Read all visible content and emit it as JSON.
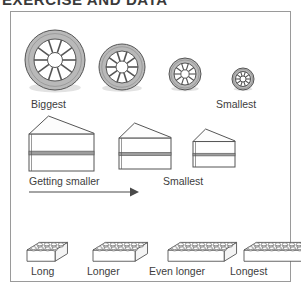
{
  "heading": "EXERCISE AND DATA",
  "figure": {
    "border_color": "#9a9a9a",
    "background": "#ffffff",
    "text_color": "#3d3d3d"
  },
  "rows": [
    {
      "name": "wheels-row",
      "kind": "tyres",
      "description": "Four wheels decreasing in size",
      "tyre_fill": "#b9b9b9",
      "hub_fill": "#ffffff",
      "outline": "#555555",
      "items": [
        {
          "order": 1,
          "size_rank": "biggest",
          "outer_r": 30,
          "inner_r": 21,
          "hub_r": 7.5,
          "spokes": 10,
          "cx": 44,
          "cy": 48
        },
        {
          "order": 2,
          "size_rank": "second",
          "outer_r": 23,
          "inner_r": 16,
          "hub_r": 6,
          "spokes": 10,
          "cx": 111,
          "cy": 55
        },
        {
          "order": 3,
          "size_rank": "third",
          "outer_r": 16,
          "inner_r": 11,
          "hub_r": 4.2,
          "spokes": 10,
          "cx": 174,
          "cy": 62
        },
        {
          "order": 4,
          "size_rank": "smallest",
          "outer_r": 11,
          "inner_r": 7.5,
          "hub_r": 3,
          "spokes": 10,
          "cx": 232,
          "cy": 67
        }
      ],
      "labels": [
        {
          "name": "wheels-label-biggest",
          "text": "Biggest",
          "x": 20,
          "y": 86
        },
        {
          "name": "wheels-label-smallest",
          "text": "Smallest",
          "x": 205,
          "y": 86
        }
      ]
    },
    {
      "name": "cakes-row",
      "kind": "cake-slices",
      "description": "Three cake slices decreasing in size",
      "body_fill": "#ffffff",
      "filling_fill": "#9d9d9d",
      "top_fill": "#fcfcfc",
      "outline": "#555555",
      "items": [
        {
          "order": 1,
          "size_rank": "biggest",
          "x": 18,
          "y": 103,
          "w": 65,
          "h": 55
        },
        {
          "order": 2,
          "size_rank": "middle",
          "x": 108,
          "y": 110,
          "w": 52,
          "h": 46
        },
        {
          "order": 3,
          "size_rank": "smallest",
          "x": 182,
          "y": 116,
          "w": 42,
          "h": 38
        }
      ],
      "labels": [
        {
          "name": "cakes-label-getting-smaller",
          "text": "Getting smaller",
          "x": 18,
          "y": 163
        },
        {
          "name": "cakes-label-smallest",
          "text": "Smallest",
          "x": 152,
          "y": 163
        }
      ],
      "arrow": {
        "name": "getting-smaller-arrow",
        "x1": 18,
        "y1": 180,
        "x2": 128,
        "y2": 180,
        "color": "#4a4a4a"
      }
    },
    {
      "name": "bricks-row",
      "kind": "lego-bricks",
      "description": "Four interlocking bricks increasing in length",
      "face_fill": "#ffffff",
      "stud_fill": "#e6e6e6",
      "outline": "#555555",
      "items": [
        {
          "order": 1,
          "length_rank": "long",
          "studs_long": 4,
          "studs_wide": 2,
          "x": 16,
          "y": 196,
          "unit": 9
        },
        {
          "order": 2,
          "length_rank": "longer",
          "studs_long": 6,
          "studs_wide": 2,
          "x": 82,
          "y": 196,
          "unit": 9
        },
        {
          "order": 3,
          "length_rank": "even-longer",
          "studs_long": 8,
          "studs_wide": 2,
          "x": 157,
          "y": 196,
          "unit": 9
        },
        {
          "order": 4,
          "length_rank": "longest",
          "studs_long": 10,
          "studs_wide": 2,
          "x": 233,
          "y": 196,
          "unit": 9
        }
      ],
      "labels": [
        {
          "name": "bricks-label-long",
          "text": "Long",
          "x": 20,
          "y": 253
        },
        {
          "name": "bricks-label-longer",
          "text": "Longer",
          "x": 76,
          "y": 253
        },
        {
          "name": "bricks-label-even-longer",
          "text": "Even longer",
          "x": 138,
          "y": 253
        },
        {
          "name": "bricks-label-longest",
          "text": "Longest",
          "x": 219,
          "y": 253
        }
      ]
    }
  ]
}
